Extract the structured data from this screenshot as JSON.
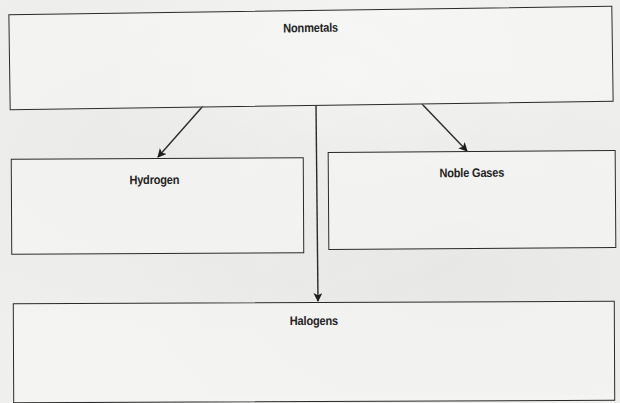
{
  "diagram": {
    "type": "hierarchy",
    "root": {
      "id": "nonmetals",
      "label": "Nonmetals"
    },
    "children": [
      {
        "id": "hydrogen",
        "label": "Hydrogen"
      },
      {
        "id": "noble_gases",
        "label": "Noble Gases"
      },
      {
        "id": "halogens",
        "label": "Halogens"
      }
    ],
    "edges": [
      {
        "from": "nonmetals",
        "to": "hydrogen"
      },
      {
        "from": "nonmetals",
        "to": "halogens"
      },
      {
        "from": "nonmetals",
        "to": "noble_gases"
      }
    ],
    "colors": {
      "line": "#2a2a2a",
      "background": "#efefed",
      "text": "#222222"
    }
  }
}
